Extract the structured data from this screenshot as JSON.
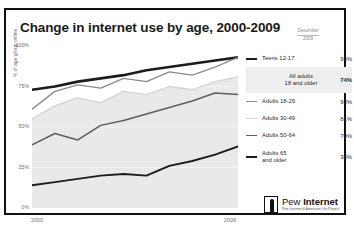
{
  "title": "Change in internet use by age, 2000-2009",
  "date_header": {
    "line1": "December",
    "line2": "2009"
  },
  "legend": {
    "items": [
      {
        "label": "Teens 12-17",
        "value": "93%",
        "swatch": "thick",
        "highlight": false
      },
      {
        "label": "All adults\n18 and older",
        "value": "74%",
        "swatch": "none",
        "highlight": true
      },
      {
        "label": "Adults 18-29",
        "value": "93%",
        "swatch": "med",
        "highlight": false
      },
      {
        "label": "Adults 30-49",
        "value": "81%",
        "swatch": "faint",
        "highlight": false
      },
      {
        "label": "Adults 50-64",
        "value": "70%",
        "swatch": "dark",
        "highlight": false
      },
      {
        "label": "Adults 65\nand older",
        "value": "38%",
        "swatch": "thick",
        "highlight": false
      }
    ]
  },
  "logo": {
    "name_light": "Pew ",
    "name_bold": "Internet",
    "tagline": "Pew Internet & American Life Project"
  },
  "chart_data": {
    "type": "line",
    "title": "Change in internet use by age, 2000-2009",
    "xlabel": "",
    "ylabel": "% of age group online",
    "ylim": [
      0,
      100
    ],
    "xlim": [
      2000,
      2009
    ],
    "grid": false,
    "legend_position": "right",
    "ytick_labels": [
      "0%",
      "25%",
      "50%",
      "75%",
      "100%"
    ],
    "ytick_values": [
      0,
      25,
      50,
      75,
      100
    ],
    "xtick_labels": [
      "2000",
      "2009"
    ],
    "xtick_values": [
      2000,
      2009
    ],
    "x": [
      2000,
      2001,
      2002,
      2003,
      2004,
      2005,
      2006,
      2007,
      2008,
      2009
    ],
    "series": [
      {
        "name": "Teens 12-17",
        "color": "#1c1c1c",
        "width": 2.6,
        "values": [
          73,
          75,
          78,
          80,
          82,
          85,
          87,
          89,
          91,
          93
        ]
      },
      {
        "name": "Adults 18-29",
        "color": "#8c8c8c",
        "width": 1.4,
        "values": [
          61,
          72,
          76,
          74,
          80,
          78,
          84,
          82,
          87,
          93
        ]
      },
      {
        "name": "Adults 30-49",
        "color": "#d2d2d2",
        "width": 1.3,
        "values": [
          55,
          63,
          68,
          65,
          72,
          70,
          75,
          73,
          78,
          81
        ]
      },
      {
        "name": "Adults 50-64",
        "color": "#5e5e5e",
        "width": 1.5,
        "values": [
          39,
          46,
          42,
          51,
          54,
          58,
          62,
          66,
          71,
          70
        ]
      },
      {
        "name": "Adults 65 and older",
        "color": "#1c1c1c",
        "width": 1.9,
        "values": [
          14,
          16,
          18,
          20,
          21,
          20,
          26,
          29,
          33,
          38
        ]
      }
    ],
    "band": {
      "name": "All adults 18 and older",
      "fill": "#e9e9e9",
      "upper": [
        55,
        63,
        68,
        65,
        72,
        70,
        75,
        73,
        78,
        81
      ],
      "lower": [
        0,
        0,
        0,
        0,
        0,
        0,
        0,
        0,
        0,
        0
      ],
      "value_2009": "74%"
    }
  }
}
